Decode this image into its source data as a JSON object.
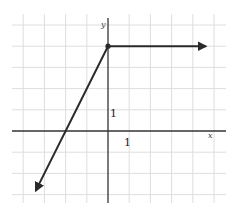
{
  "chart_data": {
    "type": "line",
    "title": "",
    "xlabel": "x",
    "ylabel": "y",
    "xlim": [
      -4,
      5
    ],
    "ylim": [
      -3,
      5
    ],
    "grid": true,
    "tick_labels": {
      "x_unit": "1",
      "y_unit": "1"
    },
    "series": [
      {
        "name": "sloped ray",
        "equation": "y = 2x + 4 for x <= 0",
        "points": [
          [
            0,
            4
          ],
          [
            -3.4,
            -2.8
          ]
        ],
        "arrow_end": [
          -3.4,
          -2.8
        ]
      },
      {
        "name": "horizontal ray",
        "equation": "y = 4 for x >= 0",
        "points": [
          [
            0,
            4
          ],
          [
            4.6,
            4
          ]
        ],
        "arrow_end": [
          4.6,
          4
        ]
      }
    ],
    "annotations": [
      {
        "type": "closed-dot",
        "at": [
          0,
          4
        ]
      }
    ]
  },
  "labels": {
    "x_axis": "x",
    "y_axis": "y",
    "x_unit": "1",
    "y_unit": "1"
  }
}
